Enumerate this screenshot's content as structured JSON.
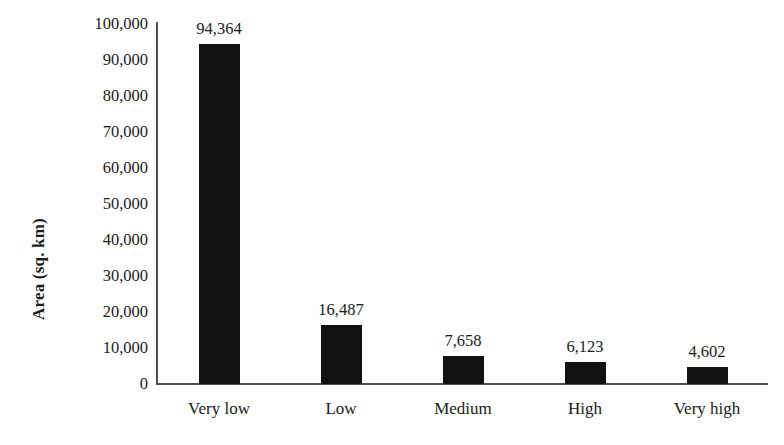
{
  "chart_data": {
    "type": "bar",
    "title": "",
    "xlabel": "",
    "ylabel": "Area (sq. km)",
    "categories": [
      "Very low",
      "Low",
      "Medium",
      "High",
      "Very high"
    ],
    "values": [
      94364,
      16487,
      7658,
      6123,
      4602
    ],
    "value_labels": [
      "94,364",
      "16,487",
      "7,658",
      "6,123",
      "4,602"
    ],
    "ylim": [
      0,
      100000
    ],
    "ytick_values": [
      0,
      10000,
      20000,
      30000,
      40000,
      50000,
      60000,
      70000,
      80000,
      90000,
      100000
    ],
    "ytick_labels": [
      "0",
      "10,000",
      "20,000",
      "30,000",
      "40,000",
      "50,000",
      "60,000",
      "70,000",
      "80,000",
      "90,000",
      "100,000"
    ],
    "grid": false,
    "legend": false,
    "bar_color": "#111111",
    "axis_color": "#4e4e4e",
    "text_color": "#1c1c1c",
    "background_color": "#fdfdfd"
  }
}
